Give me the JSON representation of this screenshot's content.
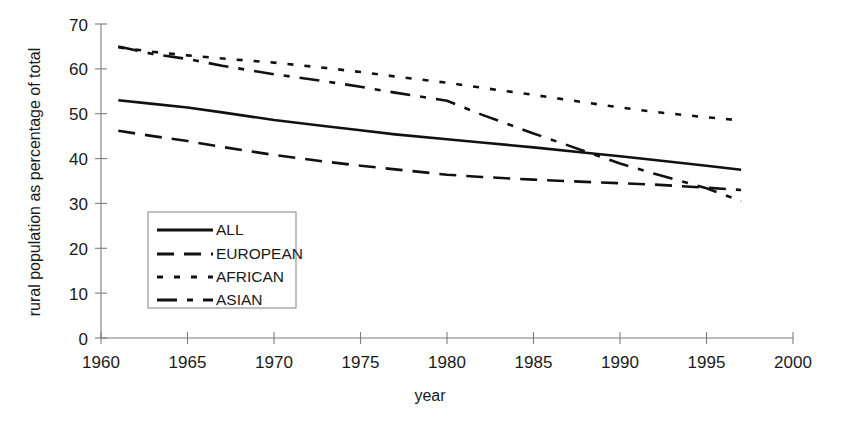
{
  "chart_data": {
    "type": "line",
    "title": "",
    "xlabel": "year",
    "ylabel": "rural population as percentage of total",
    "xlim": [
      1960,
      2000
    ],
    "ylim": [
      0,
      70
    ],
    "xticks": [
      1960,
      1965,
      1970,
      1975,
      1980,
      1985,
      1990,
      1995,
      2000
    ],
    "yticks": [
      0,
      10,
      20,
      30,
      40,
      50,
      60,
      70
    ],
    "grid": false,
    "legend_position": "inside-lower-left",
    "x": [
      1961,
      1963,
      1965,
      1967,
      1970,
      1973,
      1975,
      1977,
      1980,
      1982,
      1985,
      1988,
      1990,
      1992,
      1995,
      1997
    ],
    "series": [
      {
        "name": "ALL",
        "style": "solid",
        "values": [
          53.0,
          52.2,
          51.4,
          50.3,
          48.6,
          47.2,
          46.3,
          45.4,
          44.3,
          43.6,
          42.5,
          41.3,
          40.5,
          39.7,
          38.4,
          37.5
        ]
      },
      {
        "name": "EUROPEAN",
        "style": "dashed",
        "values": [
          46.2,
          45.0,
          43.9,
          42.6,
          40.8,
          39.3,
          38.4,
          37.6,
          36.4,
          35.9,
          35.3,
          34.8,
          34.5,
          34.2,
          33.5,
          33.0
        ]
      },
      {
        "name": "AFRICAN",
        "style": "dotted",
        "values": [
          64.8,
          63.8,
          63.0,
          62.3,
          61.4,
          60.2,
          59.3,
          58.3,
          56.9,
          55.8,
          54.2,
          52.5,
          51.4,
          50.4,
          49.2,
          48.5
        ]
      },
      {
        "name": "ASIAN",
        "style": "dash-dot",
        "values": [
          65.0,
          63.3,
          62.2,
          60.7,
          58.8,
          57.2,
          56.0,
          54.7,
          52.9,
          49.8,
          45.6,
          41.6,
          38.9,
          36.6,
          33.4,
          30.5
        ]
      }
    ]
  },
  "axis": {
    "x_tick_labels": [
      "1960",
      "1965",
      "1970",
      "1975",
      "1980",
      "1985",
      "1990",
      "1995",
      "2000"
    ],
    "y_tick_labels": [
      "0",
      "10",
      "20",
      "30",
      "40",
      "50",
      "60",
      "70"
    ],
    "x_title": "year",
    "y_title": "rural population as percentage of total"
  },
  "legend": {
    "entries": [
      {
        "label": "ALL",
        "style": "solid"
      },
      {
        "label": "EUROPEAN",
        "style": "dashed"
      },
      {
        "label": "AFRICAN",
        "style": "dotted"
      },
      {
        "label": "ASIAN",
        "style": "dash-dot"
      }
    ]
  },
  "colors": {
    "ink": "#111111",
    "axis": "#7d7d7d",
    "background": "#ffffff"
  }
}
